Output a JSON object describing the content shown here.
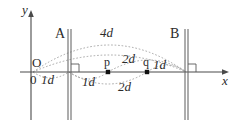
{
  "figure": {
    "type": "physics-diagram",
    "colors": {
      "background": "#ffffff",
      "axis": "#4a4a4a",
      "plate": "#6a6a6a",
      "arc": "#9a9a9a",
      "text": "#2b2b2b",
      "point": "#111111"
    },
    "axes": {
      "y_label": "y",
      "x_label": "x",
      "origin_label": "O",
      "zero_label": "0"
    },
    "plates": [
      {
        "name": "A",
        "label": "A",
        "x": 69
      },
      {
        "name": "B",
        "label": "B",
        "x": 186
      }
    ],
    "points": [
      {
        "name": "p",
        "label": "p",
        "x": 108
      },
      {
        "name": "q",
        "label": "q",
        "x": 147
      }
    ],
    "arc_labels": [
      {
        "id": "arc-4d",
        "text": "4d",
        "x": 100,
        "y": 31
      },
      {
        "id": "arc-2d-upper",
        "text": "2d",
        "x": 124,
        "y": 56
      },
      {
        "id": "arc-2d-lower",
        "text": "2d",
        "x": 122,
        "y": 83
      },
      {
        "id": "arc-1d-left",
        "text": "1d",
        "x": 43,
        "y": 76
      },
      {
        "id": "arc-1d-middle",
        "text": "1d",
        "x": 84,
        "y": 79
      },
      {
        "id": "arc-1d-right",
        "text": "1d",
        "x": 156,
        "y": 64
      }
    ]
  }
}
